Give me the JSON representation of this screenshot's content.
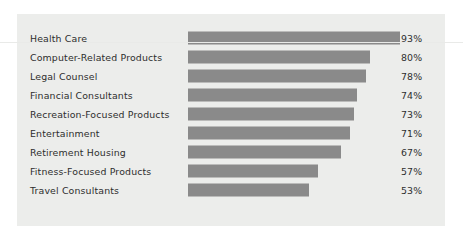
{
  "chart_data": {
    "type": "bar",
    "orientation": "horizontal",
    "title": "",
    "subtitle": "",
    "xlabel": "",
    "ylabel": "",
    "xlim": [
      0,
      100
    ],
    "grid": false,
    "legend": null,
    "value_suffix": "%",
    "categories": [
      "Health Care",
      "Computer-Related Products",
      "Legal Counsel",
      "Financial Consultants",
      "Recreation-Focused Products",
      "Entertainment",
      "Retirement Housing",
      "Fitness-Focused Products",
      "Travel Consultants"
    ],
    "values": [
      93,
      80,
      78,
      74,
      73,
      71,
      67,
      57,
      53
    ],
    "value_labels": [
      "93%",
      "80%",
      "78%",
      "74%",
      "73%",
      "71%",
      "67%",
      "57%",
      "53%"
    ],
    "colors": {
      "bar": "#8a8a8a",
      "panel_background": "#ecedeb",
      "page_background": "#ffffff",
      "text": "#2e2e2e"
    }
  }
}
